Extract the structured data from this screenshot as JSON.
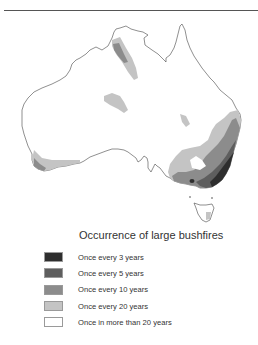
{
  "legend": {
    "title": "Occurrence of large bushfires",
    "items": [
      {
        "label": "Once every 3 years",
        "color": "#2e2e2e"
      },
      {
        "label": "Once every 5 years",
        "color": "#5e5e5e"
      },
      {
        "label": "Once every 10 years",
        "color": "#8c8c8c"
      },
      {
        "label": "Once every 20 years",
        "color": "#c4c4c4"
      },
      {
        "label": "Once in more than 20 years",
        "color": "#ffffff"
      }
    ]
  },
  "map": {
    "subject": "Australia",
    "outline_color": "#444444"
  }
}
